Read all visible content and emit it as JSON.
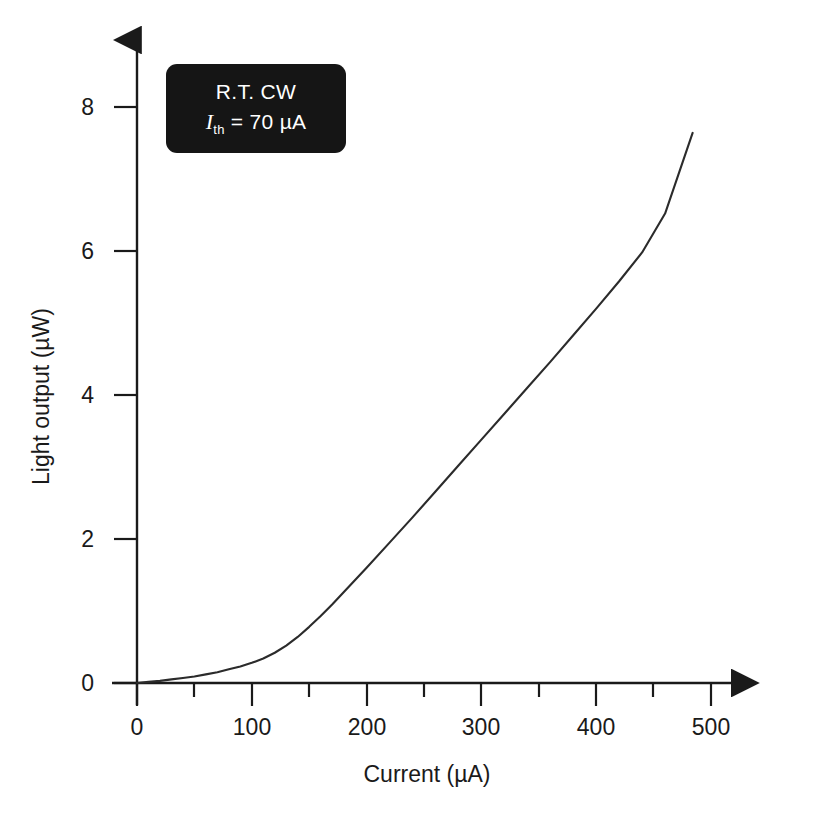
{
  "figure": {
    "background_color": "#ffffff",
    "axis_color": "#1a1a1a",
    "curve_color": "#2b2b2b"
  },
  "annotation": {
    "line1": "R.T. CW",
    "symbol": "I",
    "subscript": "th",
    "line2_rest": " = 70 µA",
    "box_color": "#151515",
    "text_color": "#ffffff"
  },
  "chart_data": {
    "type": "line",
    "title": "",
    "xlabel": "Current (µA)",
    "ylabel": "Light output (µW)",
    "xlim": [
      0,
      545
    ],
    "ylim": [
      0,
      8.8
    ],
    "grid": false,
    "legend": null,
    "xticks": [
      0,
      100,
      200,
      300,
      400,
      500
    ],
    "xtick_labels": [
      "0",
      "100",
      "200",
      "300",
      "400",
      "500"
    ],
    "xminor_ticks": [
      50,
      150,
      250,
      350,
      450
    ],
    "yticks": [
      0,
      2,
      4,
      6,
      8
    ],
    "ytick_labels": [
      "0",
      "2",
      "4",
      "6",
      "8"
    ],
    "yminor_ticks": [],
    "threshold_current": 70,
    "threshold_units": "µA",
    "series": [
      {
        "name": "Light output vs current",
        "x": [
          0,
          10,
          20,
          30,
          40,
          50,
          60,
          70,
          80,
          90,
          100,
          110,
          120,
          130,
          140,
          150,
          160,
          170,
          180,
          200,
          220,
          240,
          260,
          280,
          300,
          320,
          340,
          360,
          380,
          400,
          420,
          440,
          460,
          484
        ],
        "y": [
          0.0,
          0.015,
          0.03,
          0.05,
          0.07,
          0.09,
          0.12,
          0.15,
          0.19,
          0.23,
          0.28,
          0.34,
          0.42,
          0.52,
          0.64,
          0.78,
          0.93,
          1.09,
          1.26,
          1.6,
          1.95,
          2.3,
          2.66,
          3.02,
          3.38,
          3.74,
          4.1,
          4.46,
          4.83,
          5.2,
          5.58,
          5.98,
          6.52,
          7.64
        ]
      }
    ]
  }
}
